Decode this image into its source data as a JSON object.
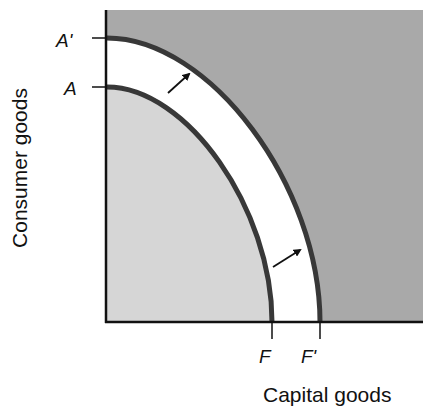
{
  "figure": {
    "type": "production-possibility-frontier-shift",
    "y_axis_label": "Consumer goods",
    "x_axis_label": "Capital goods",
    "y_ticks": [
      {
        "label": "A'",
        "meaning": "max consumer goods on outer frontier"
      },
      {
        "label": "A",
        "meaning": "max consumer goods on inner frontier"
      }
    ],
    "x_ticks": [
      {
        "label": "F",
        "meaning": "max capital goods on inner frontier"
      },
      {
        "label": "F'",
        "meaning": "max capital goods on outer frontier"
      }
    ],
    "curves": [
      {
        "name": "inner-frontier",
        "from": "A",
        "to": "F"
      },
      {
        "name": "outer-frontier",
        "from": "A'",
        "to": "F'"
      }
    ],
    "arrows": [
      {
        "name": "shift-arrow-upper",
        "direction": "outward"
      },
      {
        "name": "shift-arrow-lower",
        "direction": "outward"
      }
    ],
    "regions": [
      {
        "name": "attainable-region",
        "color": "#d6d6d6"
      },
      {
        "name": "growth-band",
        "color": "#ffffff"
      },
      {
        "name": "unattainable-region",
        "color": "#a9a9a9"
      }
    ],
    "colors": {
      "curve_stroke": "#383838",
      "axis": "#111111"
    }
  }
}
